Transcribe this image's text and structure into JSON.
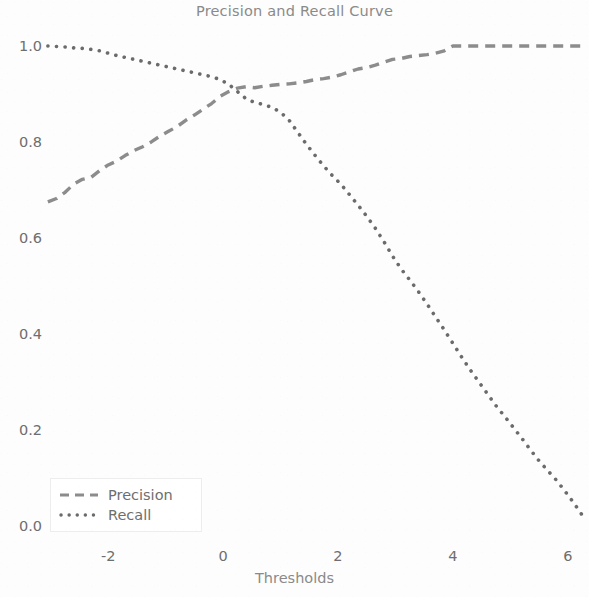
{
  "chart_data": {
    "type": "line",
    "title": "Precision and Recall Curve",
    "xlabel": "Thresholds",
    "ylabel": "",
    "xlim": [
      -3.1,
      6.3
    ],
    "ylim": [
      -0.03,
      1.05
    ],
    "grid": false,
    "legend_position": "lower left",
    "xticks": [
      "-2",
      "0",
      "2",
      "4",
      "6"
    ],
    "xtick_values": [
      -2,
      0,
      2,
      4,
      6
    ],
    "yticks": [
      "0.0",
      "0.2",
      "0.4",
      "0.6",
      "0.8",
      "1.0"
    ],
    "ytick_values": [
      0.0,
      0.2,
      0.4,
      0.6,
      0.8,
      1.0
    ],
    "series": [
      {
        "name": "Precision",
        "linestyle": "dashed",
        "color": "#8c8c8c",
        "x": [
          -3.05,
          -2.9,
          -2.75,
          -2.6,
          -2.45,
          -2.3,
          -2.15,
          -2.0,
          -1.85,
          -1.7,
          -1.55,
          -1.4,
          -1.25,
          -1.1,
          -0.95,
          -0.8,
          -0.65,
          -0.5,
          -0.35,
          -0.2,
          -0.05,
          0.1,
          0.25,
          0.4,
          0.55,
          0.7,
          0.85,
          1.0,
          1.15,
          1.3,
          1.45,
          1.6,
          1.75,
          1.9,
          2.05,
          2.2,
          2.35,
          2.5,
          2.65,
          2.8,
          2.95,
          3.1,
          3.25,
          3.4,
          3.55,
          3.7,
          3.85,
          4.0,
          4.3,
          4.6,
          4.9,
          5.2,
          5.5,
          5.8,
          6.1,
          6.25
        ],
        "values": [
          0.675,
          0.682,
          0.695,
          0.712,
          0.722,
          0.726,
          0.74,
          0.752,
          0.76,
          0.772,
          0.782,
          0.79,
          0.8,
          0.812,
          0.822,
          0.832,
          0.845,
          0.856,
          0.868,
          0.88,
          0.895,
          0.905,
          0.912,
          0.915,
          0.913,
          0.916,
          0.918,
          0.92,
          0.921,
          0.923,
          0.926,
          0.93,
          0.932,
          0.935,
          0.94,
          0.946,
          0.952,
          0.955,
          0.96,
          0.966,
          0.972,
          0.974,
          0.978,
          0.98,
          0.982,
          0.985,
          0.99,
          1.0,
          1.0,
          1.0,
          1.0,
          1.0,
          1.0,
          1.0,
          1.0,
          1.0
        ]
      },
      {
        "name": "Recall",
        "linestyle": "dotted",
        "color": "#6b6b6b",
        "x": [
          -3.05,
          -2.9,
          -2.75,
          -2.6,
          -2.45,
          -2.3,
          -2.15,
          -2.0,
          -1.85,
          -1.7,
          -1.55,
          -1.4,
          -1.25,
          -1.1,
          -0.95,
          -0.8,
          -0.65,
          -0.5,
          -0.35,
          -0.2,
          -0.05,
          0.1,
          0.25,
          0.4,
          0.55,
          0.7,
          0.85,
          1.0,
          1.15,
          1.3,
          1.45,
          1.6,
          1.75,
          1.9,
          2.05,
          2.2,
          2.35,
          2.5,
          2.65,
          2.8,
          2.95,
          3.1,
          3.25,
          3.4,
          3.55,
          3.7,
          3.85,
          4.0,
          4.15,
          4.3,
          4.45,
          4.6,
          4.75,
          4.9,
          5.05,
          5.2,
          5.35,
          5.5,
          5.65,
          5.8,
          5.95,
          6.1,
          6.25
        ],
        "values": [
          1.0,
          0.999,
          0.998,
          0.996,
          0.995,
          0.993,
          0.99,
          0.985,
          0.98,
          0.976,
          0.972,
          0.968,
          0.964,
          0.96,
          0.956,
          0.952,
          0.948,
          0.944,
          0.94,
          0.936,
          0.93,
          0.92,
          0.905,
          0.89,
          0.882,
          0.878,
          0.872,
          0.862,
          0.845,
          0.82,
          0.795,
          0.772,
          0.75,
          0.73,
          0.712,
          0.69,
          0.668,
          0.645,
          0.62,
          0.592,
          0.562,
          0.535,
          0.512,
          0.488,
          0.462,
          0.435,
          0.408,
          0.38,
          0.352,
          0.325,
          0.3,
          0.275,
          0.25,
          0.228,
          0.205,
          0.182,
          0.158,
          0.135,
          0.115,
          0.095,
          0.072,
          0.048,
          0.022
        ]
      }
    ]
  },
  "legend": {
    "items": [
      {
        "label": "Precision"
      },
      {
        "label": "Recall"
      }
    ]
  }
}
